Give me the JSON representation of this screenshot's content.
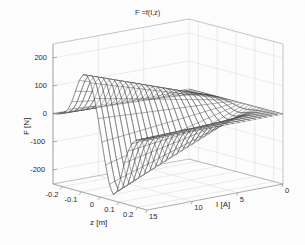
{
  "figure": {
    "title": "F =f(I,z)",
    "background_color": "#fefefe",
    "mesh_color": "#3a3a3a",
    "grid_color": "#d8d8d8",
    "axis_color": "#8a8a8a",
    "text_color": "#262626"
  },
  "axes": {
    "f": {
      "label": "F [N]",
      "ticks": [
        "200",
        "100",
        "0",
        "-100",
        "-200"
      ],
      "tick_values": [
        200,
        100,
        0,
        -100,
        -200
      ],
      "range": [
        -250,
        250
      ]
    },
    "z": {
      "label": "z [m]",
      "ticks": [
        "-0.2",
        "-0.1",
        "0",
        "0.1",
        "0.2"
      ],
      "tick_values": [
        -0.2,
        -0.1,
        0,
        0.1,
        0.2
      ],
      "range": [
        -0.25,
        0.25
      ]
    },
    "i": {
      "label": "I [A]",
      "ticks": [
        "0",
        "5",
        "10",
        "15"
      ],
      "tick_values": [
        0,
        5,
        10,
        15
      ],
      "range": [
        0,
        15
      ]
    }
  },
  "chart_data": {
    "type": "line",
    "plot_style": "mesh-surface-3d",
    "title": "F =f(I,z)",
    "xlabel": "z [m]",
    "ylabel": "I [A]",
    "zlabel": "F [N]",
    "xlim": [
      -0.25,
      0.25
    ],
    "ylim": [
      0,
      15
    ],
    "zlim": [
      -250,
      250
    ],
    "grid": true,
    "legend": null,
    "annotations": [
      "Positive force peak near z = -0.07 m at I = 15 A, F ~ 170 N",
      "Negative force trough near z = +0.08 m at I = 15 A, F ~ -230 N",
      "Surface flattens to F = 0 N as I approaches 0 A"
    ],
    "view": {
      "azimuth": -37.5,
      "elevation": 30
    },
    "mesh": {
      "z_samples": 26,
      "i_samples": 26,
      "z_values": [
        -0.25,
        -0.23,
        -0.21,
        -0.19,
        -0.17,
        -0.15,
        -0.13,
        -0.11,
        -0.09,
        -0.07,
        -0.05,
        -0.03,
        -0.01,
        0.01,
        0.03,
        0.05,
        0.07,
        0.09,
        0.11,
        0.13,
        0.15,
        0.17,
        0.19,
        0.21,
        0.23,
        0.25
      ],
      "i_values": [
        0,
        0.6,
        1.2,
        1.8,
        2.4,
        3.0,
        3.6,
        4.2,
        4.8,
        5.4,
        6.0,
        6.6,
        7.2,
        7.8,
        8.4,
        9.0,
        9.6,
        10.2,
        10.8,
        11.4,
        12.0,
        12.6,
        13.2,
        13.8,
        14.4,
        15.0
      ],
      "profile_at_Imax": [
        2,
        4,
        8,
        16,
        32,
        62,
        104,
        146,
        170,
        172,
        148,
        96,
        28,
        -52,
        -130,
        -196,
        -228,
        -214,
        -162,
        -104,
        -58,
        -28,
        -13,
        -6,
        -3,
        -1
      ],
      "scaling": "F(z,I) = profile(z) * (I / 15)"
    }
  }
}
